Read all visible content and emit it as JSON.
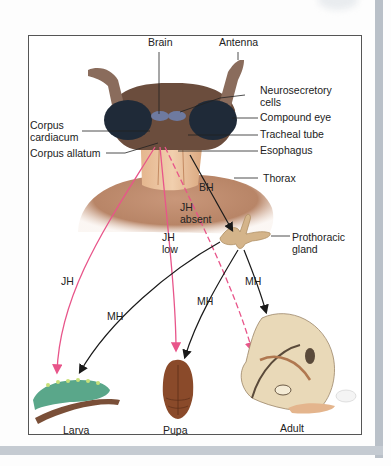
{
  "figure": {
    "structure_labels": {
      "brain": "Brain",
      "antenna": "Antenna",
      "neurosecretory_cells": [
        "Neurosecretory",
        "cells"
      ],
      "compound_eye": "Compound eye",
      "tracheal_tube": "Tracheal tube",
      "esophagus": "Esophagus",
      "thorax": "Thorax",
      "corpus_cardiacum": [
        "Corpus",
        "cardiacum"
      ],
      "corpus_allatum": "Corpus allatum",
      "prothoracic_gland": [
        "Prothoracic",
        "gland"
      ]
    },
    "hormone_labels": {
      "bh": "BH",
      "jh_absent": [
        "JH",
        "absent"
      ],
      "jh_low": [
        "JH",
        "low"
      ],
      "jh": "JH",
      "mh_left": "MH",
      "mh_center": "MH",
      "mh_right": "MH"
    },
    "stages": {
      "larva": "Larva",
      "pupa": "Pupa",
      "adult": "Adult"
    },
    "colors": {
      "jh_arrow": "#e8558a",
      "mh_arrow": "#1a1a1a",
      "thorax": "#b98566",
      "eye": "#1f2a38",
      "larva": "#5aa78a",
      "pupa": "#8a4a2a",
      "moth": "#e9d9b8"
    }
  }
}
